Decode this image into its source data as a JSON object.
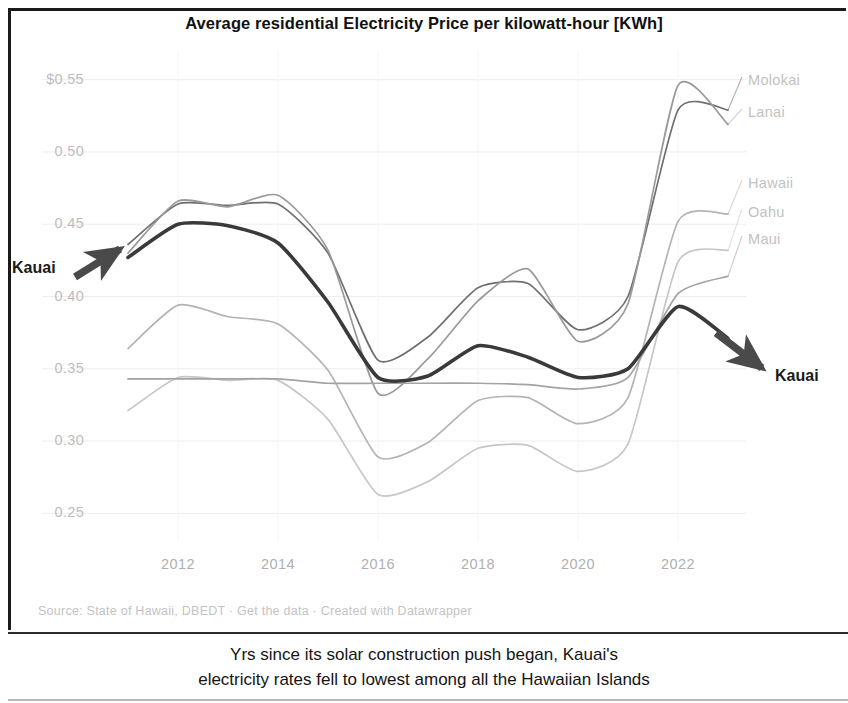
{
  "chart": {
    "title": "Average residential Electricity Price per kilowatt-hour [KWh]",
    "source": "Source: State of Hawaii, DBEDT · Get the data · Created with Datawrapper",
    "caption_line1": "Yrs since its solar construction push began, Kauai's",
    "caption_line2": "electricity rates fell to lowest among all the Hawaiian Islands",
    "annotation_left": "Kauai",
    "annotation_right": "Kauai"
  },
  "chart_data": {
    "type": "line",
    "title": "Average residential Electricity Price per kilowatt-hour [KWh]",
    "xlabel": "",
    "ylabel": "",
    "xlim": [
      2010.6,
      2023.2
    ],
    "ylim": [
      0.235,
      0.565
    ],
    "grid": true,
    "legend_position": "right-inline",
    "ytick_labels": [
      "$0.55",
      "0.50",
      "0.45",
      "0.40",
      "0.35",
      "0.30",
      "0.25"
    ],
    "ytick_values": [
      0.55,
      0.5,
      0.45,
      0.4,
      0.35,
      0.3,
      0.25
    ],
    "xtick_labels": [
      "2012",
      "2014",
      "2016",
      "2018",
      "2020",
      "2022"
    ],
    "xtick_values": [
      2012,
      2014,
      2016,
      2018,
      2020,
      2022
    ],
    "x": [
      2011,
      2012,
      2013,
      2014,
      2015,
      2016,
      2017,
      2018,
      2019,
      2020,
      2021,
      2022,
      2023
    ],
    "series": [
      {
        "name": "Kauai",
        "color": "#3a3a3a",
        "width": 3.6,
        "highlight": true,
        "values": [
          0.427,
          0.45,
          0.449,
          0.437,
          0.396,
          0.344,
          0.345,
          0.366,
          0.358,
          0.344,
          0.35,
          0.393,
          0.371
        ]
      },
      {
        "name": "Molokai",
        "color": "#6f6f6f",
        "width": 1.7,
        "highlight": false,
        "values": [
          0.436,
          0.464,
          0.463,
          0.464,
          0.43,
          0.356,
          0.372,
          0.406,
          0.409,
          0.377,
          0.4,
          0.529,
          0.529
        ]
      },
      {
        "name": "Lanai",
        "color": "#9a9a9a",
        "width": 1.7,
        "highlight": false,
        "values": [
          0.43,
          0.466,
          0.462,
          0.47,
          0.432,
          0.333,
          0.357,
          0.397,
          0.419,
          0.369,
          0.395,
          0.546,
          0.519
        ]
      },
      {
        "name": "Hawaii",
        "color": "#b4b4b4",
        "width": 1.7,
        "highlight": false,
        "values": [
          0.364,
          0.394,
          0.386,
          0.381,
          0.349,
          0.289,
          0.299,
          0.328,
          0.33,
          0.312,
          0.33,
          0.452,
          0.457
        ]
      },
      {
        "name": "Oahu",
        "color": "#c6c6c6",
        "width": 1.7,
        "highlight": false,
        "values": [
          0.321,
          0.344,
          0.342,
          0.342,
          0.315,
          0.263,
          0.272,
          0.295,
          0.297,
          0.279,
          0.298,
          0.424,
          0.432
        ]
      },
      {
        "name": "Maui",
        "color": "#a3a3a3",
        "width": 1.7,
        "highlight": false,
        "values": [
          0.343,
          0.343,
          0.343,
          0.343,
          0.34,
          0.34,
          0.34,
          0.34,
          0.339,
          0.336,
          0.344,
          0.402,
          0.414
        ]
      }
    ],
    "series_labels": [
      {
        "name": "Molokai",
        "x": 748,
        "y": 72
      },
      {
        "name": "Lanai",
        "x": 748,
        "y": 104
      },
      {
        "name": "Hawaii",
        "x": 748,
        "y": 175
      },
      {
        "name": "Oahu",
        "x": 748,
        "y": 204
      },
      {
        "name": "Maui",
        "x": 748,
        "y": 231
      }
    ],
    "annotations": [
      {
        "text": "Kauai",
        "x": 12,
        "y": 259,
        "arrow": "up-right"
      },
      {
        "text": "Kauai",
        "x": 775,
        "y": 367,
        "arrow": "down-right"
      }
    ]
  }
}
